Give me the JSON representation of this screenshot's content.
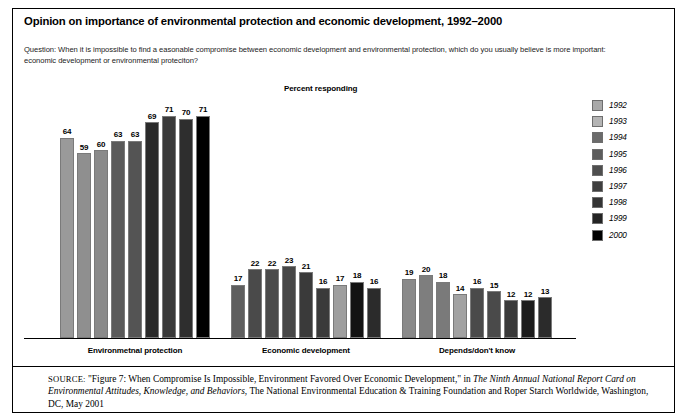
{
  "title": "Opinion on importance of environmental protection and economic development, 1992–2000",
  "question": "Question: When it is impossible to find a easonable compromise between economic development and environmental protection, which do you usually believe is more important: economic development or environmental proteciton?",
  "axis_note": "Percent responding",
  "source": {
    "tag": "SOURCE:",
    "part1": " \"Figure 7: When Compromise Is Impossible, Environment Favored Over Economic Development,\" in ",
    "italic1": "The Ninth Annual National Report Card on Environmental Attitudes, Knowledge, and Behaviors",
    "part2": ", The National Environmental Education & Training Foundation and Roper Starch Worldwide, Washington, DC, May 2001"
  },
  "legend": {
    "position": "right",
    "entries": [
      {
        "label": "1992",
        "color": "#a9a9a9"
      },
      {
        "label": "1993",
        "color": "#b4b4b4"
      },
      {
        "label": "1994",
        "color": "#6b6b6b"
      },
      {
        "label": "1995",
        "color": "#5c5c5c"
      },
      {
        "label": "1996",
        "color": "#4e4e4e"
      },
      {
        "label": "1997",
        "color": "#3f3f3f"
      },
      {
        "label": "1998",
        "color": "#343434"
      },
      {
        "label": "1999",
        "color": "#242424"
      },
      {
        "label": "2000",
        "color": "#000000"
      }
    ]
  },
  "chart_data": {
    "type": "bar",
    "title": "Opinion on importance of environmental protection and economic development, 1992–2000",
    "xlabel": "",
    "ylabel": "Percent responding",
    "ylim": [
      0,
      80
    ],
    "grid": false,
    "legend_position": "right",
    "categories": [
      "Environmetnal protection",
      "Economic development",
      "Depends/don't know"
    ],
    "series": [
      {
        "name": "1992",
        "color": "#a9a9a9",
        "values": [
          64,
          17,
          19
        ]
      },
      {
        "name": "1993",
        "color": "#b4b4b4",
        "values": [
          59,
          22,
          20
        ]
      },
      {
        "name": "1994",
        "color": "#6b6b6b",
        "values": [
          60,
          22,
          18
        ]
      },
      {
        "name": "1995",
        "color": "#5c5c5c",
        "values": [
          63,
          23,
          14
        ]
      },
      {
        "name": "1996",
        "color": "#4e4e4e",
        "values": [
          63,
          21,
          16
        ]
      },
      {
        "name": "1997",
        "color": "#3f3f3f",
        "values": [
          69,
          16,
          15
        ]
      },
      {
        "name": "1998",
        "color": "#343434",
        "values": [
          71,
          17,
          12
        ]
      },
      {
        "name": "1999",
        "color": "#242424",
        "values": [
          70,
          18,
          12
        ]
      },
      {
        "name": "2000",
        "color": "#000000",
        "values": [
          71,
          16,
          13
        ]
      }
    ],
    "group_bar_colors": [
      [
        "#9a9a9a",
        "#8f8f8f",
        "#8a8a8a",
        "#5a5a5a",
        "#545454",
        "#2a2a2a",
        "#3a3a3a",
        "#2e2e2e",
        "#000000"
      ],
      [
        "#5e5e5e",
        "#4a4a4a",
        "#4a4a4a",
        "#474747",
        "#3a3a3a",
        "#3a3a3a",
        "#9e9e9e",
        "#121212",
        "#2b2b2b"
      ],
      [
        "#8a8a8a",
        "#7e7e7e",
        "#7a7a7a",
        "#a2a2a2",
        "#4a4a4a",
        "#4a4a4a",
        "#3a3a3a",
        "#1c1c1c",
        "#2b2b2b"
      ]
    ]
  }
}
